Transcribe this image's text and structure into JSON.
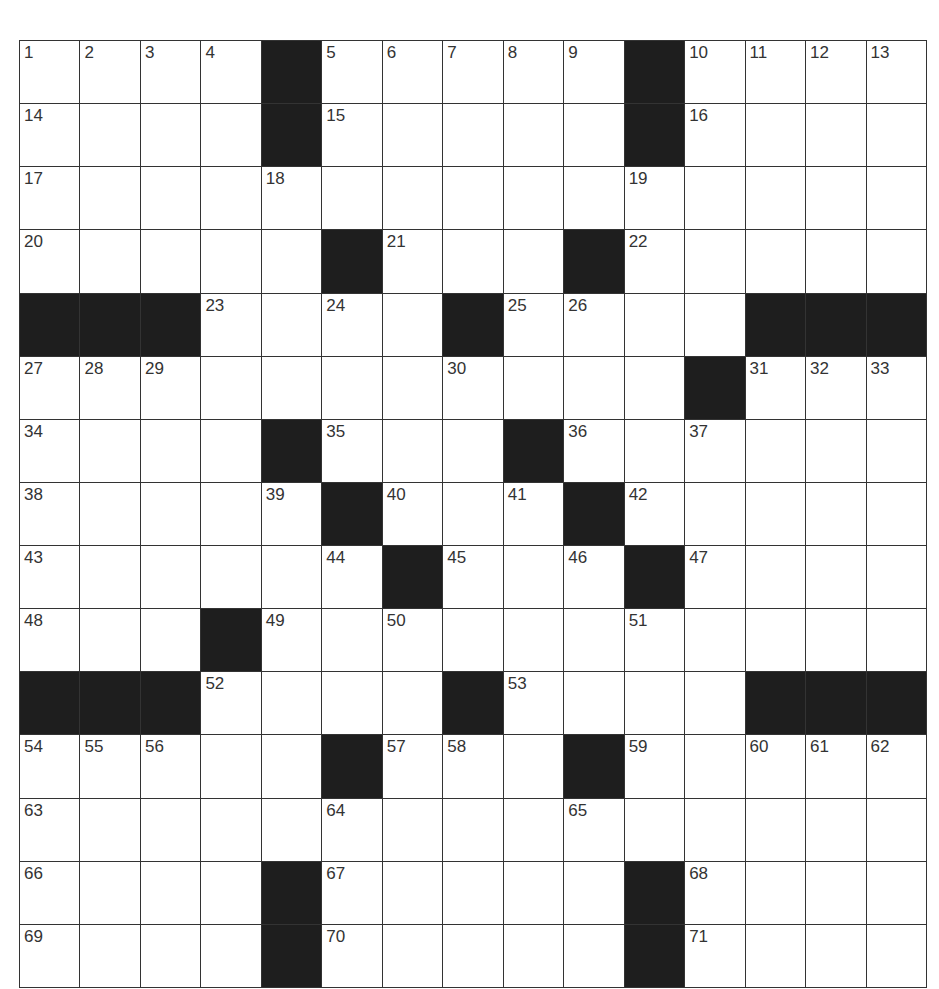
{
  "puzzle": {
    "size": {
      "rows": 15,
      "cols": 15
    },
    "colors": {
      "block": "#1e1e1e",
      "cell": "#ffffff",
      "line": "#333333",
      "number": "#333333"
    },
    "grid": [
      "....#.....#....",
      "....#.....#....",
      "...............",
      ".....#...#.....",
      "###....#....###",
      "...........#...",
      "....#...#......",
      ".....#...#.....",
      "......#...#....",
      "...#...........",
      "###....#....###",
      ".....#...#.....",
      "...............",
      "....#.....#....",
      "....#.....#...."
    ],
    "numbers": [
      [
        0,
        0,
        1
      ],
      [
        0,
        1,
        2
      ],
      [
        0,
        2,
        3
      ],
      [
        0,
        3,
        4
      ],
      [
        0,
        5,
        5
      ],
      [
        0,
        6,
        6
      ],
      [
        0,
        7,
        7
      ],
      [
        0,
        8,
        8
      ],
      [
        0,
        9,
        9
      ],
      [
        0,
        11,
        10
      ],
      [
        0,
        12,
        11
      ],
      [
        0,
        13,
        12
      ],
      [
        0,
        14,
        13
      ],
      [
        1,
        0,
        14
      ],
      [
        1,
        5,
        15
      ],
      [
        1,
        11,
        16
      ],
      [
        2,
        0,
        17
      ],
      [
        2,
        4,
        18
      ],
      [
        2,
        10,
        19
      ],
      [
        3,
        0,
        20
      ],
      [
        3,
        6,
        21
      ],
      [
        3,
        10,
        22
      ],
      [
        4,
        3,
        23
      ],
      [
        4,
        5,
        24
      ],
      [
        4,
        8,
        25
      ],
      [
        4,
        9,
        26
      ],
      [
        5,
        0,
        27
      ],
      [
        5,
        1,
        28
      ],
      [
        5,
        2,
        29
      ],
      [
        5,
        7,
        30
      ],
      [
        5,
        12,
        31
      ],
      [
        5,
        13,
        32
      ],
      [
        5,
        14,
        33
      ],
      [
        6,
        0,
        34
      ],
      [
        6,
        5,
        35
      ],
      [
        6,
        9,
        36
      ],
      [
        6,
        11,
        37
      ],
      [
        7,
        0,
        38
      ],
      [
        7,
        4,
        39
      ],
      [
        7,
        6,
        40
      ],
      [
        7,
        8,
        41
      ],
      [
        7,
        10,
        42
      ],
      [
        8,
        0,
        43
      ],
      [
        8,
        5,
        44
      ],
      [
        8,
        7,
        45
      ],
      [
        8,
        9,
        46
      ],
      [
        8,
        11,
        47
      ],
      [
        9,
        0,
        48
      ],
      [
        9,
        4,
        49
      ],
      [
        9,
        6,
        50
      ],
      [
        9,
        10,
        51
      ],
      [
        10,
        3,
        52
      ],
      [
        10,
        8,
        53
      ],
      [
        11,
        0,
        54
      ],
      [
        11,
        1,
        55
      ],
      [
        11,
        2,
        56
      ],
      [
        11,
        6,
        57
      ],
      [
        11,
        7,
        58
      ],
      [
        11,
        10,
        59
      ],
      [
        11,
        12,
        60
      ],
      [
        11,
        13,
        61
      ],
      [
        11,
        14,
        62
      ],
      [
        12,
        0,
        63
      ],
      [
        12,
        5,
        64
      ],
      [
        12,
        9,
        65
      ],
      [
        13,
        0,
        66
      ],
      [
        13,
        5,
        67
      ],
      [
        13,
        11,
        68
      ],
      [
        14,
        0,
        69
      ],
      [
        14,
        5,
        70
      ],
      [
        14,
        11,
        71
      ]
    ]
  }
}
